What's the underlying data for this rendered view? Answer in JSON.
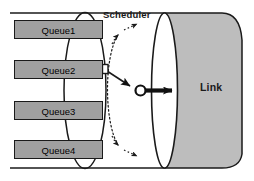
{
  "diagram": {
    "title_visible": false,
    "type": "network-scheduler-diagram",
    "scheduler": {
      "label": "Scheduler"
    },
    "link": {
      "label": "Link"
    },
    "queues": [
      {
        "label": "Queue1"
      },
      {
        "label": "Queue2"
      },
      {
        "label": "Queue3"
      },
      {
        "label": "Queue4"
      }
    ],
    "packet": {
      "name": "packet",
      "source_queue": "Queue2"
    },
    "annotations": {
      "service_arc": "dashed-arc-with-arrowheads",
      "transmit_arrow": "solid-arrow-into-link",
      "server_node": "small-circle"
    },
    "colors": {
      "queue_fill": "#a0a0a0",
      "queue_stroke": "#1a1a1a",
      "cylinder_fill": "#bdbdbd",
      "cylinder_face": "#ffffff",
      "stroke": "#1a1a1a",
      "text": "#1a1a1a",
      "background": "#ffffff"
    }
  }
}
